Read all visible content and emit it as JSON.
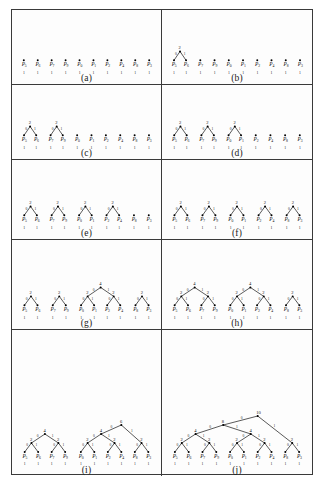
{
  "figure": {
    "leaf_order": [
      "P5",
      "P6",
      "P7",
      "P9",
      "P0",
      "P1",
      "P2",
      "P4",
      "P8",
      "P3"
    ],
    "leaf_weights": [
      1,
      1,
      1,
      1,
      1,
      1,
      1,
      1,
      1,
      1
    ],
    "edge_labels": {
      "left": "0",
      "right": "1"
    },
    "colors": {
      "border": "#3a3a3a",
      "node": "#000000",
      "edge": "#111111",
      "text": "#111111",
      "background": "#fdfdfd"
    }
  },
  "panels": [
    {
      "id": "a",
      "caption": "(a)",
      "forest": [
        {
          "weight": 1,
          "leaves": [
            "P5"
          ]
        },
        {
          "weight": 1,
          "leaves": [
            "P6"
          ]
        },
        {
          "weight": 1,
          "leaves": [
            "P7"
          ]
        },
        {
          "weight": 1,
          "leaves": [
            "P9"
          ]
        },
        {
          "weight": 1,
          "leaves": [
            "P0"
          ]
        },
        {
          "weight": 1,
          "leaves": [
            "P1"
          ]
        },
        {
          "weight": 1,
          "leaves": [
            "P2"
          ]
        },
        {
          "weight": 1,
          "leaves": [
            "P4"
          ]
        },
        {
          "weight": 1,
          "leaves": [
            "P8"
          ]
        },
        {
          "weight": 1,
          "leaves": [
            "P3"
          ]
        }
      ]
    },
    {
      "id": "b",
      "caption": "(b)",
      "forest": [
        {
          "weight": 2,
          "leaves": [
            "P5",
            "P6"
          ]
        },
        {
          "weight": 1,
          "leaves": [
            "P7"
          ]
        },
        {
          "weight": 1,
          "leaves": [
            "P9"
          ]
        },
        {
          "weight": 1,
          "leaves": [
            "P0"
          ]
        },
        {
          "weight": 1,
          "leaves": [
            "P1"
          ]
        },
        {
          "weight": 1,
          "leaves": [
            "P2"
          ]
        },
        {
          "weight": 1,
          "leaves": [
            "P4"
          ]
        },
        {
          "weight": 1,
          "leaves": [
            "P8"
          ]
        },
        {
          "weight": 1,
          "leaves": [
            "P3"
          ]
        }
      ]
    },
    {
      "id": "c",
      "caption": "(c)",
      "forest": [
        {
          "weight": 2,
          "leaves": [
            "P5",
            "P6"
          ]
        },
        {
          "weight": 2,
          "leaves": [
            "P7",
            "P9"
          ]
        },
        {
          "weight": 1,
          "leaves": [
            "P0"
          ]
        },
        {
          "weight": 1,
          "leaves": [
            "P1"
          ]
        },
        {
          "weight": 1,
          "leaves": [
            "P2"
          ]
        },
        {
          "weight": 1,
          "leaves": [
            "P4"
          ]
        },
        {
          "weight": 1,
          "leaves": [
            "P8"
          ]
        },
        {
          "weight": 1,
          "leaves": [
            "P3"
          ]
        }
      ]
    },
    {
      "id": "d",
      "caption": "(d)",
      "forest": [
        {
          "weight": 2,
          "leaves": [
            "P5",
            "P6"
          ]
        },
        {
          "weight": 2,
          "leaves": [
            "P7",
            "P9"
          ]
        },
        {
          "weight": 2,
          "leaves": [
            "P0",
            "P1"
          ]
        },
        {
          "weight": 1,
          "leaves": [
            "P2"
          ]
        },
        {
          "weight": 1,
          "leaves": [
            "P4"
          ]
        },
        {
          "weight": 1,
          "leaves": [
            "P8"
          ]
        },
        {
          "weight": 1,
          "leaves": [
            "P3"
          ]
        }
      ]
    },
    {
      "id": "e",
      "caption": "(e)",
      "forest": [
        {
          "weight": 2,
          "leaves": [
            "P5",
            "P6"
          ]
        },
        {
          "weight": 2,
          "leaves": [
            "P7",
            "P9"
          ]
        },
        {
          "weight": 2,
          "leaves": [
            "P0",
            "P1"
          ]
        },
        {
          "weight": 2,
          "leaves": [
            "P2",
            "P4"
          ]
        },
        {
          "weight": 1,
          "leaves": [
            "P8"
          ]
        },
        {
          "weight": 1,
          "leaves": [
            "P3"
          ]
        }
      ]
    },
    {
      "id": "f",
      "caption": "(f)",
      "forest": [
        {
          "weight": 2,
          "leaves": [
            "P5",
            "P6"
          ]
        },
        {
          "weight": 2,
          "leaves": [
            "P7",
            "P9"
          ]
        },
        {
          "weight": 2,
          "leaves": [
            "P0",
            "P1"
          ]
        },
        {
          "weight": 2,
          "leaves": [
            "P2",
            "P4"
          ]
        },
        {
          "weight": 2,
          "leaves": [
            "P8",
            "P3"
          ]
        }
      ]
    },
    {
      "id": "g",
      "caption": "(g)",
      "forest": [
        {
          "weight": 2,
          "leaves": [
            "P5",
            "P6"
          ]
        },
        {
          "weight": 2,
          "leaves": [
            "P7",
            "P9"
          ]
        },
        {
          "weight": 4,
          "leaves": [
            "P0",
            "P1",
            "P2",
            "P4"
          ]
        },
        {
          "weight": 2,
          "leaves": [
            "P8",
            "P3"
          ]
        }
      ]
    },
    {
      "id": "h",
      "caption": "(h)",
      "forest": [
        {
          "weight": 4,
          "leaves": [
            "P5",
            "P6",
            "P7",
            "P9"
          ]
        },
        {
          "weight": 4,
          "leaves": [
            "P0",
            "P1",
            "P2",
            "P4"
          ]
        },
        {
          "weight": 2,
          "leaves": [
            "P8",
            "P3"
          ]
        }
      ]
    },
    {
      "id": "i",
      "caption": "(i)",
      "forest": [
        {
          "weight": 4,
          "leaves": [
            "P5",
            "P6",
            "P7",
            "P9"
          ]
        },
        {
          "weight": 6,
          "leaves": [
            "P0",
            "P1",
            "P2",
            "P4",
            "P8",
            "P3"
          ]
        }
      ]
    },
    {
      "id": "j",
      "caption": "(j)",
      "forest": [
        {
          "weight": 10,
          "leaves": [
            "P5",
            "P6",
            "P7",
            "P9",
            "P0",
            "P1",
            "P2",
            "P4",
            "P8",
            "P3"
          ]
        }
      ]
    }
  ]
}
